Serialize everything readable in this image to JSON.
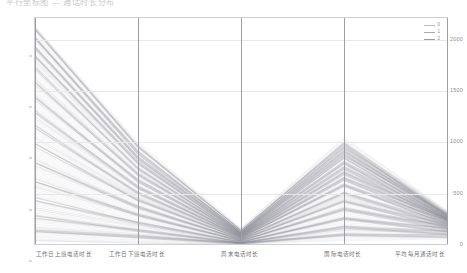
{
  "title": "平行坐标图 — 通话时长分布",
  "legend": {
    "position": "top-right",
    "entries": [
      {
        "label": "0",
        "color": "#b9bcc0"
      },
      {
        "label": "1",
        "color": "#a8abaf"
      },
      {
        "label": "2",
        "color": "#9a9da1"
      }
    ]
  },
  "chart_data": {
    "type": "line",
    "subtype": "parallel-coordinates",
    "title": "平行坐标图 — 通话时长分布",
    "xlabel": "",
    "ylabel": "",
    "grid": true,
    "ylim": [
      0,
      2200
    ],
    "yticks": [
      0,
      500,
      1000,
      1500,
      2000
    ],
    "ytick_labels": [
      "0",
      "500",
      "1000",
      "1500",
      "2000"
    ],
    "axes": [
      {
        "index": 0,
        "label": "工作日上班电话时长"
      },
      {
        "index": 1,
        "label": "工作日下班电话时长"
      },
      {
        "index": 2,
        "label": "周末电话时长"
      },
      {
        "index": 3,
        "label": "国际电话时长"
      },
      {
        "index": 4,
        "label": "平均每月通话时长"
      }
    ],
    "categories": [
      "工作日上班电话时长",
      "工作日下班电话时长",
      "周末电话时长",
      "国际电话时长",
      "平均每月通话时长"
    ],
    "line_color": "#8e9296",
    "line_opacity": 0.18,
    "series_count": 320,
    "series": [
      {
        "name": "profile-high-1",
        "values": [
          2120,
          980,
          150,
          1010,
          300
        ]
      },
      {
        "name": "profile-high-2",
        "values": [
          2080,
          940,
          130,
          980,
          290
        ]
      },
      {
        "name": "profile-high-3",
        "values": [
          2030,
          900,
          120,
          950,
          285
        ]
      },
      {
        "name": "profile-high-4",
        "values": [
          1980,
          880,
          115,
          930,
          280
        ]
      },
      {
        "name": "profile-high-5",
        "values": [
          1930,
          850,
          110,
          905,
          275
        ]
      },
      {
        "name": "profile-high-6",
        "values": [
          1880,
          820,
          105,
          880,
          270
        ]
      },
      {
        "name": "profile-high-7",
        "values": [
          1830,
          800,
          100,
          860,
          268
        ]
      },
      {
        "name": "profile-high-8",
        "values": [
          1780,
          770,
          98,
          835,
          265
        ]
      },
      {
        "name": "profile-mid-1",
        "values": [
          1700,
          730,
          92,
          800,
          258
        ]
      },
      {
        "name": "profile-mid-2",
        "values": [
          1620,
          700,
          88,
          770,
          252
        ]
      },
      {
        "name": "profile-mid-3",
        "values": [
          1540,
          665,
          84,
          740,
          246
        ]
      },
      {
        "name": "profile-mid-4",
        "values": [
          1460,
          630,
          80,
          710,
          240
        ]
      },
      {
        "name": "profile-mid-5",
        "values": [
          1380,
          600,
          76,
          680,
          234
        ]
      },
      {
        "name": "profile-mid-6",
        "values": [
          1300,
          565,
          72,
          650,
          228
        ]
      },
      {
        "name": "profile-mid-7",
        "values": [
          1220,
          530,
          68,
          620,
          222
        ]
      },
      {
        "name": "profile-mid-8",
        "values": [
          1140,
          500,
          64,
          590,
          216
        ]
      },
      {
        "name": "profile-low-1",
        "values": [
          1040,
          460,
          58,
          545,
          206
        ]
      },
      {
        "name": "profile-low-2",
        "values": [
          940,
          420,
          52,
          500,
          196
        ]
      },
      {
        "name": "profile-low-3",
        "values": [
          840,
          380,
          46,
          455,
          186
        ]
      },
      {
        "name": "profile-low-4",
        "values": [
          740,
          340,
          40,
          410,
          176
        ]
      },
      {
        "name": "profile-low-5",
        "values": [
          640,
          300,
          34,
          365,
          166
        ]
      },
      {
        "name": "profile-low-6",
        "values": [
          540,
          260,
          28,
          320,
          156
        ]
      },
      {
        "name": "profile-low-7",
        "values": [
          440,
          215,
          22,
          270,
          144
        ]
      },
      {
        "name": "profile-low-8",
        "values": [
          340,
          170,
          16,
          220,
          130
        ]
      },
      {
        "name": "profile-base-1",
        "values": [
          250,
          130,
          11,
          175,
          116
        ]
      },
      {
        "name": "profile-base-2",
        "values": [
          170,
          95,
          8,
          130,
          100
        ]
      },
      {
        "name": "profile-base-3",
        "values": [
          100,
          60,
          5,
          90,
          80
        ]
      },
      {
        "name": "profile-base-4",
        "values": [
          50,
          30,
          2,
          50,
          55
        ]
      }
    ],
    "notes": [
      "轴1 数值分布最广，由顶部密集下降",
      "轴3 处所有折线收束至接近 0",
      "轴4 处折线再次展开形成峰形",
      "轴5 处折线收束为窄带"
    ]
  }
}
